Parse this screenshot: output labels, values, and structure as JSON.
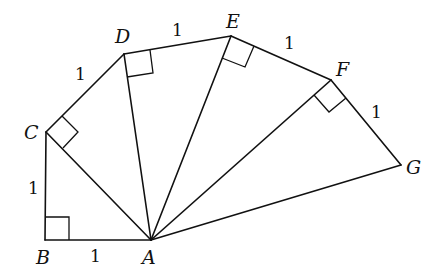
{
  "diagram": {
    "type": "square-root spiral (spiral of Theodorus)",
    "points": {
      "A": {
        "label": "A",
        "x": 151,
        "y": 240
      },
      "B": {
        "label": "B",
        "x": 45,
        "y": 240
      },
      "C": {
        "label": "C",
        "x": 46,
        "y": 132
      },
      "D": {
        "label": "D",
        "x": 124,
        "y": 54
      },
      "E": {
        "label": "E",
        "x": 231,
        "y": 36
      },
      "F": {
        "label": "F",
        "x": 331,
        "y": 80
      },
      "G": {
        "label": "G",
        "x": 401,
        "y": 165
      }
    },
    "outer_segments": [
      {
        "from": "B",
        "to": "A",
        "length_label": "1"
      },
      {
        "from": "B",
        "to": "C",
        "length_label": "1"
      },
      {
        "from": "C",
        "to": "D",
        "length_label": "1"
      },
      {
        "from": "D",
        "to": "E",
        "length_label": "1"
      },
      {
        "from": "E",
        "to": "F",
        "length_label": "1"
      },
      {
        "from": "F",
        "to": "G",
        "length_label": "1"
      }
    ],
    "radial_segments": [
      "AC",
      "AD",
      "AE",
      "AF",
      "AG"
    ],
    "right_angles": [
      "B",
      "C",
      "D",
      "E",
      "F"
    ]
  }
}
